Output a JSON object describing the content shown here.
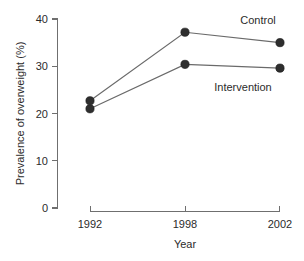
{
  "chart_data": {
    "type": "line",
    "title": "",
    "xlabel": "Year",
    "ylabel": "Prevalence of overweight (%)",
    "x": [
      1992,
      1998,
      2002
    ],
    "xtick_labels": [
      "1992",
      "1998",
      "2002"
    ],
    "ytick_labels": [
      "0",
      "10",
      "20",
      "30",
      "40"
    ],
    "yticks": [
      0,
      10,
      20,
      30,
      40
    ],
    "ylim": [
      0,
      40
    ],
    "xlim": [
      1992,
      2002
    ],
    "grid": false,
    "legend_position": "inline-right",
    "marker": "filled-circle",
    "marker_color": "#2e2e2e",
    "line_color": "#6a6a6a",
    "axis_color": "#6f6f6f",
    "background": "#ffffff",
    "series": [
      {
        "name": "Control",
        "values": [
          22.7,
          37.2,
          35.0
        ],
        "label": "Control"
      },
      {
        "name": "Intervention",
        "values": [
          21.0,
          30.4,
          29.6
        ],
        "label": "Intervention"
      }
    ]
  }
}
